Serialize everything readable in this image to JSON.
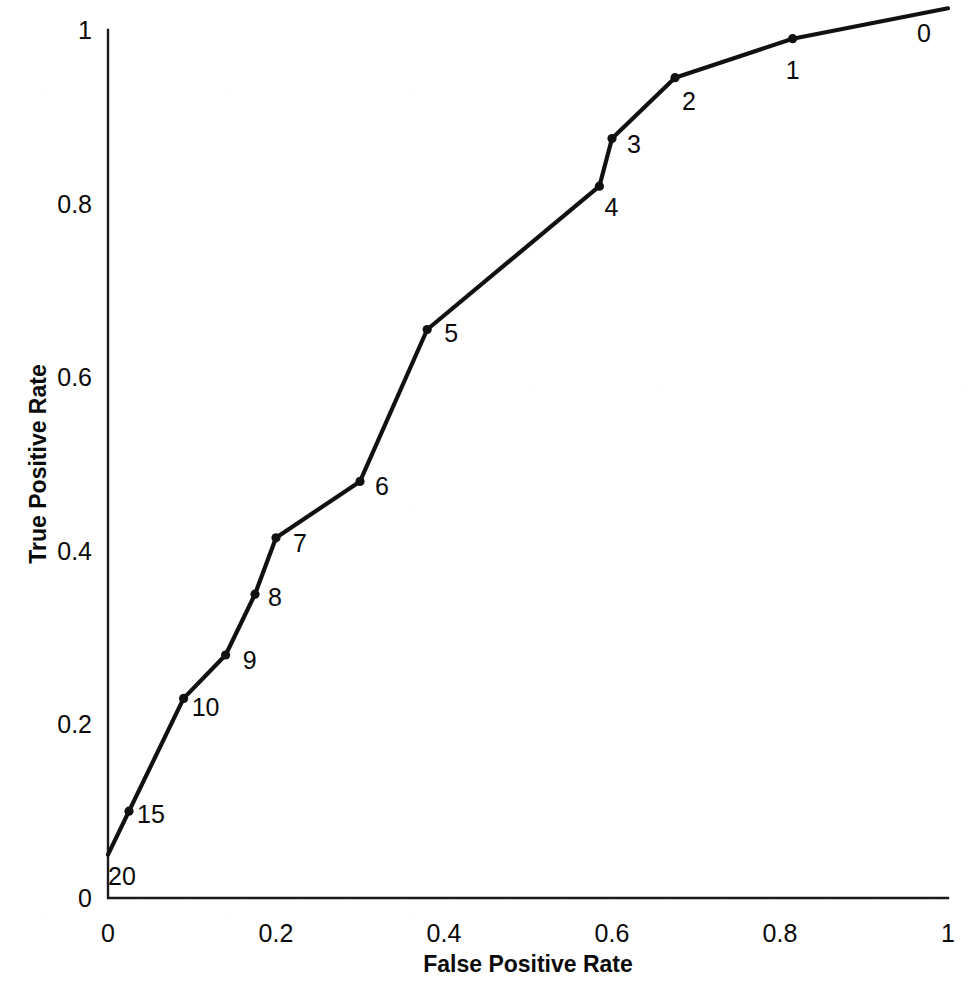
{
  "chart_data": {
    "type": "line",
    "title": "",
    "xlabel": "False Positive Rate",
    "ylabel": "True Positive Rate",
    "xlim": [
      0,
      1
    ],
    "ylim": [
      0,
      1
    ],
    "grid": false,
    "legend": "none",
    "xticks": [
      "0",
      "0.2",
      "0.4",
      "0.6",
      "0.8",
      "1"
    ],
    "xtick_values": [
      0,
      0.2,
      0.4,
      0.6,
      0.8,
      1
    ],
    "yticks": [
      "0",
      "0.2",
      "0.4",
      "0.6",
      "0.8",
      "1"
    ],
    "ytick_values": [
      0,
      0.2,
      0.4,
      0.6,
      0.8,
      1
    ],
    "series": [
      {
        "name": "ROC curve",
        "point_labels": [
          "20",
          "15",
          "10",
          "9",
          "8",
          "7",
          "6",
          "5",
          "4",
          "3",
          "2",
          "1",
          "0"
        ],
        "x": [
          0.0,
          0.025,
          0.09,
          0.14,
          0.175,
          0.2,
          0.3,
          0.38,
          0.585,
          0.6,
          0.675,
          0.815,
          1.0
        ],
        "y": [
          0.05,
          0.1,
          0.23,
          0.28,
          0.35,
          0.415,
          0.48,
          0.655,
          0.82,
          0.875,
          0.945,
          0.99,
          1.025
        ]
      }
    ],
    "annotations": [
      {
        "text": "20",
        "x": 0.0,
        "y": 0.05
      },
      {
        "text": "15",
        "x": 0.025,
        "y": 0.1
      },
      {
        "text": "10",
        "x": 0.09,
        "y": 0.23
      },
      {
        "text": "9",
        "x": 0.14,
        "y": 0.28
      },
      {
        "text": "8",
        "x": 0.175,
        "y": 0.35
      },
      {
        "text": "7",
        "x": 0.2,
        "y": 0.415
      },
      {
        "text": "6",
        "x": 0.3,
        "y": 0.48
      },
      {
        "text": "5",
        "x": 0.38,
        "y": 0.655
      },
      {
        "text": "4",
        "x": 0.585,
        "y": 0.82
      },
      {
        "text": "3",
        "x": 0.6,
        "y": 0.875
      },
      {
        "text": "2",
        "x": 0.675,
        "y": 0.945
      },
      {
        "text": "1",
        "x": 0.815,
        "y": 0.99
      },
      {
        "text": "0",
        "x": 1.0,
        "y": 1.025
      }
    ]
  },
  "axes": {
    "x_title": "False Positive Rate",
    "y_title": "True Positive Rate"
  },
  "colors": {
    "line": "#111111",
    "axis": "#1a1a1a",
    "text": "#0a0a0a",
    "background": "#ffffff"
  }
}
